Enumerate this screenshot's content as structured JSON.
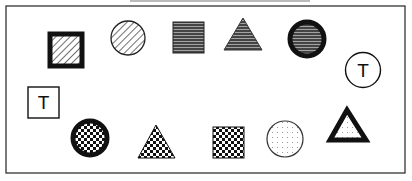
{
  "figure": {
    "frame": {
      "x": 6,
      "y": 6,
      "width": 399,
      "height": 167,
      "stroke": "#333333"
    },
    "shapes": [
      {
        "id": "hatched-square-thick",
        "type": "square",
        "fill": "diagonal-hatch",
        "border": "thick",
        "x": 48,
        "y": 32,
        "size": 36
      },
      {
        "id": "hatched-circle",
        "type": "circle",
        "fill": "diagonal-hatch",
        "border": "thin",
        "cx": 128,
        "cy": 38,
        "r": 17
      },
      {
        "id": "striped-square",
        "type": "square",
        "fill": "dark-horizontal-stripes",
        "border": "thin",
        "x": 173,
        "y": 22,
        "size": 31
      },
      {
        "id": "striped-triangle",
        "type": "triangle",
        "fill": "dark-horizontal-stripes",
        "border": "thin",
        "points": [
          [
            243,
            18
          ],
          [
            224,
            50
          ],
          [
            262,
            50
          ]
        ]
      },
      {
        "id": "striped-circle-thick",
        "type": "circle",
        "fill": "dark-horizontal-stripes",
        "border": "thick",
        "cx": 307,
        "cy": 39,
        "r": 19
      },
      {
        "id": "t-circle",
        "type": "circle",
        "fill": "none",
        "border": "thin",
        "cx": 363,
        "cy": 70,
        "r": 18,
        "label": "T"
      },
      {
        "id": "t-square",
        "type": "square",
        "fill": "none",
        "border": "thin",
        "x": 28,
        "y": 87,
        "size": 31,
        "label": "T"
      },
      {
        "id": "checker-circle-thick",
        "type": "circle",
        "fill": "checkerboard",
        "border": "thick",
        "cx": 90,
        "cy": 138,
        "r": 19
      },
      {
        "id": "checker-triangle",
        "type": "triangle",
        "fill": "checkerboard",
        "border": "thin",
        "points": [
          [
            156,
            125
          ],
          [
            138,
            158
          ],
          [
            175,
            158
          ]
        ]
      },
      {
        "id": "checker-square",
        "type": "square",
        "fill": "checkerboard",
        "border": "thin",
        "x": 213,
        "y": 127,
        "size": 31
      },
      {
        "id": "dotted-circle",
        "type": "circle",
        "fill": "dots",
        "border": "thin",
        "cx": 285,
        "cy": 139,
        "r": 18
      },
      {
        "id": "dotted-triangle-thick",
        "type": "triangle",
        "fill": "dots",
        "border": "thick",
        "points": [
          [
            347,
            107
          ],
          [
            327,
            142
          ],
          [
            370,
            142
          ]
        ]
      }
    ],
    "labels": {
      "t_circle": "T",
      "t_square": "T"
    }
  }
}
